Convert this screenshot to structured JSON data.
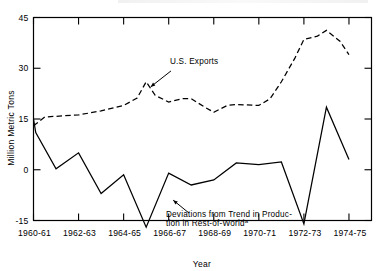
{
  "chart_data": {
    "type": "line",
    "title": "",
    "xlabel": "Year",
    "ylabel": "Million Metric Tons",
    "ylim": [
      -21,
      45
    ],
    "xlim": [
      1960,
      1974
    ],
    "yticks": [
      45,
      30,
      15,
      0,
      -15
    ],
    "ytick_labels": [
      "45",
      "30",
      "15",
      "0",
      "-15"
    ],
    "x": [
      1960,
      1961,
      1962,
      1963,
      1964,
      1965,
      1966,
      1967,
      1968,
      1969,
      1970,
      1971,
      1972,
      1973,
      1974
    ],
    "xtick_values": [
      1960,
      1962,
      1964,
      1966,
      1968,
      1970,
      1972,
      1974
    ],
    "xtick_labels": [
      "1960-61",
      "1962-63",
      "1964-65",
      "1966-67",
      "1968-69",
      "1970-71",
      "1972-73",
      "1974-75"
    ],
    "grid": false,
    "legend": "none",
    "series": [
      {
        "name": "U.S. Exports",
        "style": "dashed",
        "values": [
          13.0,
          15.8,
          16.0,
          17.0,
          19.0,
          20.5,
          26.0,
          20.0,
          21.0,
          17.0,
          19.0,
          19.5,
          19.0,
          26.0,
          38.5
        ]
      },
      {
        "name": "Deviations from Trend in Production in Rest-of-World",
        "style": "solid",
        "values": [
          15.0,
          11.0,
          0.3,
          5.0,
          -7.0,
          -1.5,
          -17.0,
          -1.0,
          -4.5,
          -3.0,
          2.0,
          1.5,
          2.3,
          -16.0,
          18.5
        ]
      }
    ],
    "series_extended": [
      {
        "name": "U.S. Exports",
        "points": [
          [
            1960,
            13.0
          ],
          [
            1960.5,
            15.6
          ],
          [
            1961,
            15.8
          ],
          [
            1962,
            16.2
          ],
          [
            1963,
            17.4
          ],
          [
            1964,
            19.0
          ],
          [
            1964.6,
            21.2
          ],
          [
            1965,
            26.0
          ],
          [
            1965.4,
            22.0
          ],
          [
            1966,
            20.0
          ],
          [
            1966.6,
            21.0
          ],
          [
            1967,
            21.0
          ],
          [
            1967.6,
            18.5
          ],
          [
            1968,
            17.0
          ],
          [
            1968.6,
            19.0
          ],
          [
            1969,
            19.3
          ],
          [
            1970,
            19.0
          ],
          [
            1970.5,
            21.0
          ],
          [
            1971,
            26.0
          ],
          [
            1971.6,
            33.0
          ],
          [
            1972,
            38.5
          ],
          [
            1972.6,
            39.5
          ],
          [
            1973,
            41.2
          ],
          [
            1973.6,
            38.0
          ],
          [
            1974,
            34.0
          ]
        ]
      },
      {
        "name": "Deviations from Trend in Production in Rest-of-World",
        "points": [
          [
            1960,
            15.0
          ],
          [
            1960.1,
            11.0
          ],
          [
            1961,
            0.3
          ],
          [
            1962,
            5.0
          ],
          [
            1963,
            -7.0
          ],
          [
            1964,
            -1.5
          ],
          [
            1965,
            -17.0
          ],
          [
            1966,
            -1.0
          ],
          [
            1967,
            -4.5
          ],
          [
            1968,
            -3.0
          ],
          [
            1969,
            2.0
          ],
          [
            1970,
            1.5
          ],
          [
            1971,
            2.3
          ],
          [
            1972,
            -16.0
          ],
          [
            1973,
            18.5
          ],
          [
            1974,
            3.0
          ]
        ]
      }
    ],
    "annotations": [
      {
        "id": "us-exports",
        "text": "U.S. Exports",
        "arrow_from": [
          1966.1,
          29.2
        ],
        "arrow_to": [
          1965.2,
          24.5
        ]
      },
      {
        "id": "deviations",
        "line1": "Deviations from Trend in Produc-",
        "line2": "tion in Rest-of-World",
        "superscript": "a",
        "arrow_from": [
          1966.9,
          -12.8
        ],
        "arrow_to": [
          1966.2,
          -9.0
        ]
      }
    ]
  }
}
